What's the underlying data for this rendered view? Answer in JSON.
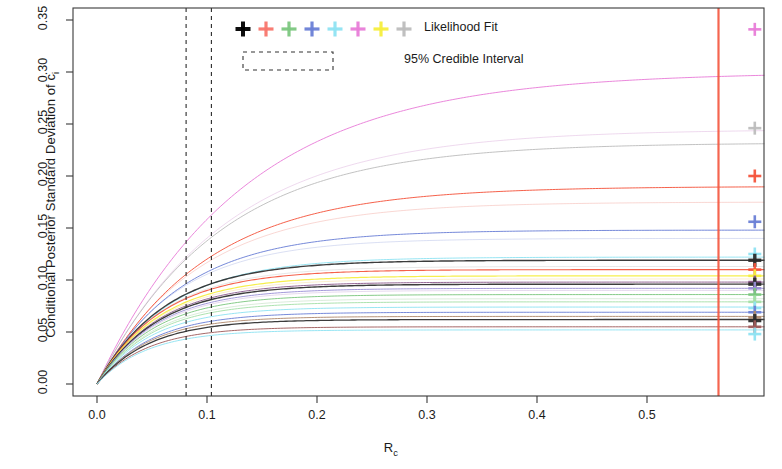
{
  "chart_data": {
    "type": "line",
    "title": "",
    "xlabel": "R_c",
    "xlabel_base": "R",
    "xlabel_sub": "c",
    "ylabel": "Conditional Posterior Standard Deviation of c_i",
    "ylabel_base": "Conditional Posterior Standard Deviation of c",
    "ylabel_sub": "i",
    "xlim": [
      -0.012,
      0.625
    ],
    "ylim": [
      -0.003,
      0.359
    ],
    "xticks": [
      0.0,
      0.1,
      0.2,
      0.3,
      0.4,
      0.5
    ],
    "xtick_labels": [
      "0.0",
      "0.1",
      "0.2",
      "0.3",
      "0.4",
      "0.5"
    ],
    "yticks": [
      0.0,
      0.05,
      0.1,
      0.15,
      0.2,
      0.25,
      0.3,
      0.35
    ],
    "ytick_labels": [
      "0.00",
      "0.05",
      "0.10",
      "0.15",
      "0.20",
      "0.25",
      "0.30",
      "0.35"
    ],
    "grid": false,
    "legend_position": "top-center",
    "legend_entries": [
      {
        "label": "Likelihood Fit",
        "marker": "plus",
        "colors": [
          "#000000",
          "#F8766D",
          "#7CC77F",
          "#6A7FD6",
          "#8FE3F2",
          "#E87DD8",
          "#F5EE3D",
          "#BDBDBD"
        ]
      },
      {
        "label": "95% Credible Interval",
        "marker": "dashed-box",
        "color": "#333333"
      }
    ],
    "vertical_reference_lines": [
      {
        "x": 0.081,
        "style": "dashed",
        "color": "#2b2b2b",
        "name": "credible-interval-lower"
      },
      {
        "x": 0.104,
        "style": "dashed",
        "color": "#2b2b2b",
        "name": "credible-interval-upper"
      },
      {
        "x": 0.565,
        "style": "solid",
        "color": "#F4543C",
        "name": "likelihood-fit-line"
      }
    ],
    "marker_x": 0.598,
    "series": [
      {
        "name": "curve-01",
        "color": "#E87DD8",
        "asymptote": 0.3,
        "rate": 7.5,
        "marker_y": 0.341,
        "width": 1.0
      },
      {
        "name": "curve-02",
        "color": "#BDBDBD",
        "asymptote": 0.232,
        "rate": 9.0,
        "marker_y": 0.246,
        "width": 1.0
      },
      {
        "name": "curve-03",
        "color": "#F4543C",
        "asymptote": 0.19,
        "rate": 10.0,
        "marker_y": 0.2,
        "width": 1.0
      },
      {
        "name": "curve-04",
        "color": "#6A7FD6",
        "asymptote": 0.148,
        "rate": 13.0,
        "marker_y": 0.156,
        "width": 1.0
      },
      {
        "name": "curve-05",
        "color": "#8FE3F2",
        "asymptote": 0.122,
        "rate": 15.0,
        "marker_y": 0.125,
        "width": 1.0
      },
      {
        "name": "curve-06",
        "color": "#2b2b2b",
        "asymptote": 0.119,
        "rate": 16.0,
        "marker_y": 0.119,
        "width": 1.4
      },
      {
        "name": "curve-07",
        "color": "#F4543C",
        "asymptote": 0.11,
        "rate": 17.0,
        "marker_y": 0.11,
        "width": 1.1
      },
      {
        "name": "curve-08",
        "color": "#F5EE3D",
        "asymptote": 0.104,
        "rate": 17.5,
        "marker_y": 0.104,
        "width": 1.2
      },
      {
        "name": "curve-09",
        "color": "#8B5A8C",
        "asymptote": 0.098,
        "rate": 18.0,
        "marker_y": 0.098,
        "width": 1.0
      },
      {
        "name": "curve-10",
        "color": "#2b2b2b",
        "asymptote": 0.096,
        "rate": 18.0,
        "marker_y": 0.096,
        "width": 1.4
      },
      {
        "name": "curve-11",
        "color": "#9A8FD6",
        "asymptote": 0.092,
        "rate": 18.5,
        "marker_y": 0.092,
        "width": 1.0
      },
      {
        "name": "curve-12",
        "color": "#7CC77F",
        "asymptote": 0.086,
        "rate": 19.0,
        "marker_y": 0.086,
        "width": 1.0
      },
      {
        "name": "curve-13",
        "color": "#A5E0A8",
        "asymptote": 0.079,
        "rate": 19.5,
        "marker_y": 0.079,
        "width": 1.0
      },
      {
        "name": "curve-14",
        "color": "#8FE3F2",
        "asymptote": 0.074,
        "rate": 20.0,
        "marker_y": 0.073,
        "width": 1.0
      },
      {
        "name": "curve-15",
        "color": "#6A7FD6",
        "asymptote": 0.069,
        "rate": 20.0,
        "marker_y": 0.069,
        "width": 1.0
      },
      {
        "name": "curve-16",
        "color": "#B08A6E",
        "asymptote": 0.065,
        "rate": 21.0,
        "marker_y": 0.064,
        "width": 1.0
      },
      {
        "name": "curve-17",
        "color": "#2b2b2b",
        "asymptote": 0.062,
        "rate": 21.0,
        "marker_y": 0.061,
        "width": 1.3
      },
      {
        "name": "curve-18",
        "color": "#9E5B5B",
        "asymptote": 0.055,
        "rate": 22.0,
        "marker_y": 0.055,
        "width": 1.0
      },
      {
        "name": "curve-19",
        "color": "#8FE3F2",
        "asymptote": 0.052,
        "rate": 22.0,
        "marker_y": 0.048,
        "width": 1.0
      }
    ],
    "extra_faint_curves": [
      {
        "name": "faint-01",
        "color": "#D9A8D9",
        "asymptote": 0.245,
        "rate": 8.5,
        "width": 0.8
      },
      {
        "name": "faint-02",
        "color": "#F2A49B",
        "asymptote": 0.175,
        "rate": 11.0,
        "width": 0.8
      },
      {
        "name": "faint-03",
        "color": "#A9B6E3",
        "asymptote": 0.14,
        "rate": 14.0,
        "width": 0.8
      },
      {
        "name": "faint-04",
        "color": "#C9C9C9",
        "asymptote": 0.113,
        "rate": 16.5,
        "width": 0.8
      },
      {
        "name": "faint-05",
        "color": "#F7D98A",
        "asymptote": 0.101,
        "rate": 17.8,
        "width": 0.8
      },
      {
        "name": "faint-06",
        "color": "#C6A9D9",
        "asymptote": 0.09,
        "rate": 18.5,
        "width": 0.8
      },
      {
        "name": "faint-07",
        "color": "#A8D4A8",
        "asymptote": 0.082,
        "rate": 19.2,
        "width": 0.8
      }
    ]
  },
  "axes": {
    "y_title_text": "Conditional Posterior Standard Deviation of c",
    "y_title_sub": "i",
    "x_title_text": "R",
    "x_title_sub": "c"
  },
  "legend": {
    "likelihood_fit_label": "Likelihood Fit",
    "credible_interval_label": "95% Credible Interval"
  }
}
